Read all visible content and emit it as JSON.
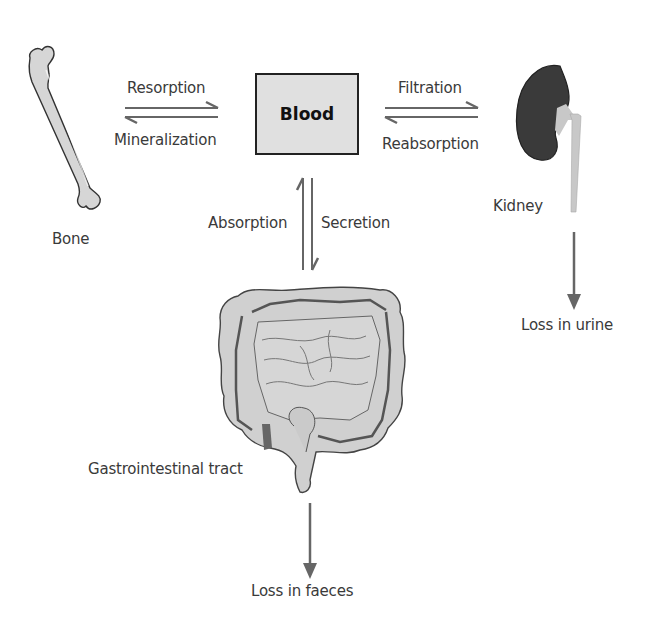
{
  "nodes": {
    "blood": {
      "label": "Blood"
    },
    "bone": {
      "label": "Bone"
    },
    "kidney": {
      "label": "Kidney"
    },
    "gi_tract": {
      "label": "Gastrointestinal tract"
    }
  },
  "flows": {
    "bone_to_blood": {
      "label": "Resorption"
    },
    "blood_to_bone": {
      "label": "Mineralization"
    },
    "blood_to_kidney": {
      "label": "Filtration"
    },
    "kidney_to_blood": {
      "label": "Reabsorption"
    },
    "gi_to_blood": {
      "label": "Absorption"
    },
    "blood_to_gi": {
      "label": "Secretion"
    }
  },
  "outputs": {
    "urine": {
      "label": "Loss in urine"
    },
    "faeces": {
      "label": "Loss in faeces"
    }
  },
  "colors": {
    "arrow": "#666666",
    "box_fill": "#e0e0e0",
    "organ_fill": "#cfcfcf",
    "kidney_fill": "#3a3a3a",
    "outline": "#333333"
  }
}
